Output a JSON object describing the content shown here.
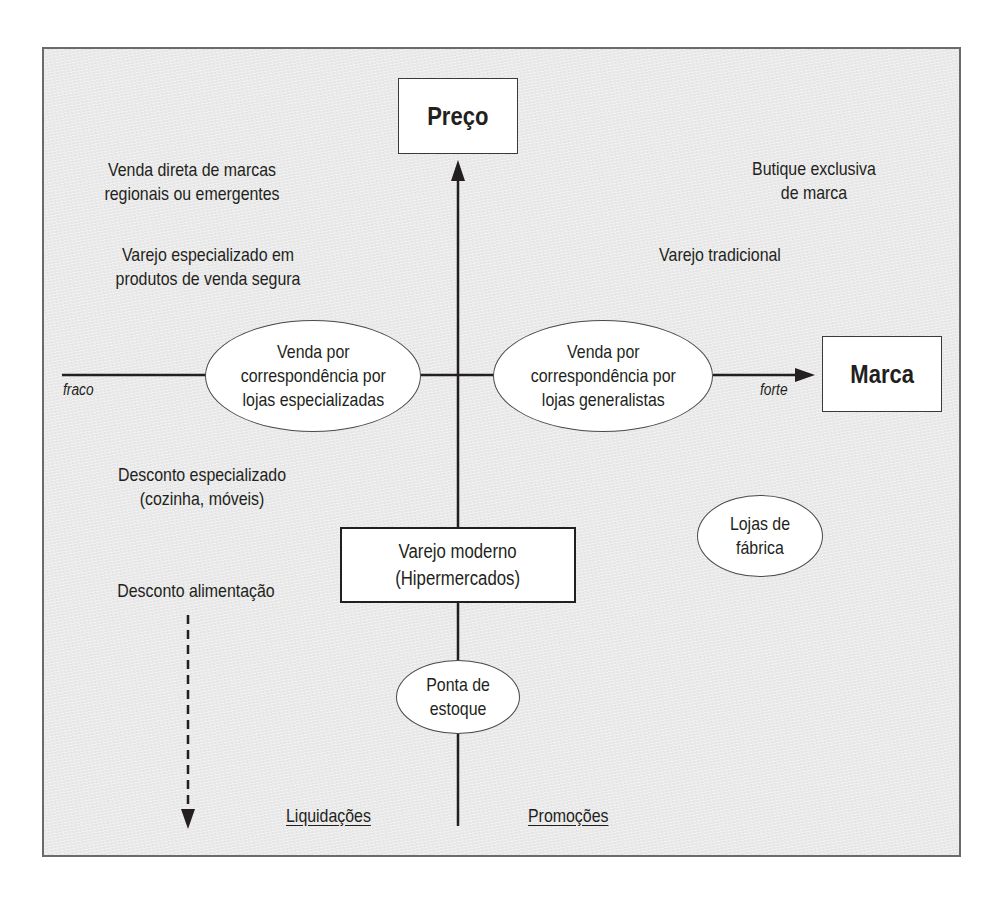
{
  "diagram": {
    "type": "positioning-map",
    "axes": {
      "vertical": {
        "label": "Preço"
      },
      "horizontal": {
        "label": "Marca",
        "low_label": "fraco",
        "high_label": "forte"
      }
    },
    "quadrant_labels": {
      "top_left_1": [
        "Venda direta de marcas",
        "regionais ou emergentes"
      ],
      "top_left_2": [
        "Varejo especializado em",
        "produtos de venda segura"
      ],
      "top_right_1": [
        "Butique exclusiva",
        "de marca"
      ],
      "top_right_2": [
        "Varejo tradicional"
      ],
      "bottom_left_1": [
        "Desconto especializado",
        "(cozinha, móveis)"
      ],
      "bottom_left_2": [
        "Desconto alimentação"
      ]
    },
    "ellipses": {
      "left": [
        "Venda por",
        "correspondência por",
        "lojas especializadas"
      ],
      "right": [
        "Venda por",
        "correspondência por",
        "lojas generalistas"
      ],
      "factory": [
        "Lojas de",
        "fábrica"
      ],
      "stock": [
        "Ponta de",
        "estoque"
      ]
    },
    "center_box": [
      "Varejo moderno",
      "(Hipermercados)"
    ],
    "bottom_labels": {
      "left": "Liquidações",
      "right": "Promoções"
    },
    "colors": {
      "background": "#e9e9e9",
      "box_fill": "#ffffff",
      "line": "#231f20",
      "text": "#231f20"
    }
  }
}
